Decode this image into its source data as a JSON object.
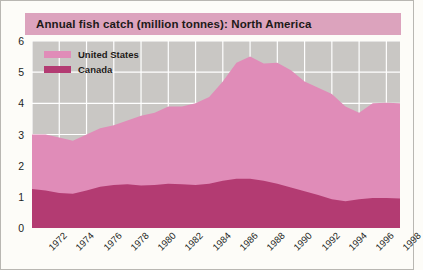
{
  "title": "Annual fish catch (million tonnes): North America",
  "colors": {
    "title_bar": "#dca3bd",
    "plot_background": "#c9c7c4",
    "united_states": "#e08cb8",
    "canada": "#b33b72",
    "gridline": "#ffffff",
    "page_background": "#fdfcf8"
  },
  "legend": {
    "position": "top-left-inside",
    "entries": [
      {
        "label": "United States",
        "color": "#e08cb8"
      },
      {
        "label": "Canada",
        "color": "#b33b72"
      }
    ]
  },
  "chart_data": {
    "type": "area",
    "stacked": true,
    "title": "Annual fish catch (million tonnes): North America",
    "xlabel": "",
    "ylabel": "",
    "ylim": [
      0,
      6
    ],
    "xlim": [
      1972,
      1999
    ],
    "grid": true,
    "ytick_labels": [
      "0",
      "1",
      "2",
      "3",
      "4",
      "5",
      "6"
    ],
    "ytick_values": [
      0,
      1,
      2,
      3,
      4,
      5,
      6
    ],
    "xtick_labels": [
      "1972",
      "1974",
      "1976",
      "1978",
      "1980",
      "1982",
      "1984",
      "1986",
      "1988",
      "1990",
      "1992",
      "1994",
      "1996",
      "1998"
    ],
    "xtick_values": [
      1972,
      1974,
      1976,
      1978,
      1980,
      1982,
      1984,
      1986,
      1988,
      1990,
      1992,
      1994,
      1996,
      1998
    ],
    "x": [
      1972,
      1973,
      1974,
      1975,
      1976,
      1977,
      1978,
      1979,
      1980,
      1981,
      1982,
      1983,
      1984,
      1985,
      1986,
      1987,
      1988,
      1989,
      1990,
      1991,
      1992,
      1993,
      1994,
      1995,
      1996,
      1997,
      1998,
      1999
    ],
    "series": [
      {
        "name": "Canada",
        "color": "#b33b72",
        "values": [
          1.25,
          1.2,
          1.12,
          1.1,
          1.2,
          1.32,
          1.38,
          1.4,
          1.36,
          1.38,
          1.42,
          1.4,
          1.38,
          1.42,
          1.52,
          1.58,
          1.58,
          1.52,
          1.42,
          1.3,
          1.18,
          1.06,
          0.92,
          0.86,
          0.92,
          0.96,
          0.96,
          0.95
        ]
      },
      {
        "name": "United States",
        "color": "#e08cb8",
        "values": [
          1.75,
          1.8,
          1.78,
          1.7,
          1.8,
          1.88,
          1.92,
          2.05,
          2.24,
          2.32,
          2.48,
          2.5,
          2.62,
          2.78,
          3.18,
          3.72,
          3.92,
          3.76,
          3.88,
          3.76,
          3.52,
          3.44,
          3.38,
          3.04,
          2.78,
          3.04,
          3.06,
          3.05
        ]
      }
    ],
    "totals": [
      3.0,
      3.0,
      2.9,
      2.8,
      3.0,
      3.2,
      3.3,
      3.45,
      3.6,
      3.7,
      3.9,
      3.9,
      4.0,
      4.2,
      4.7,
      5.3,
      5.5,
      5.28,
      5.3,
      5.06,
      4.7,
      4.5,
      4.3,
      3.9,
      3.7,
      4.0,
      4.02,
      4.0
    ]
  }
}
